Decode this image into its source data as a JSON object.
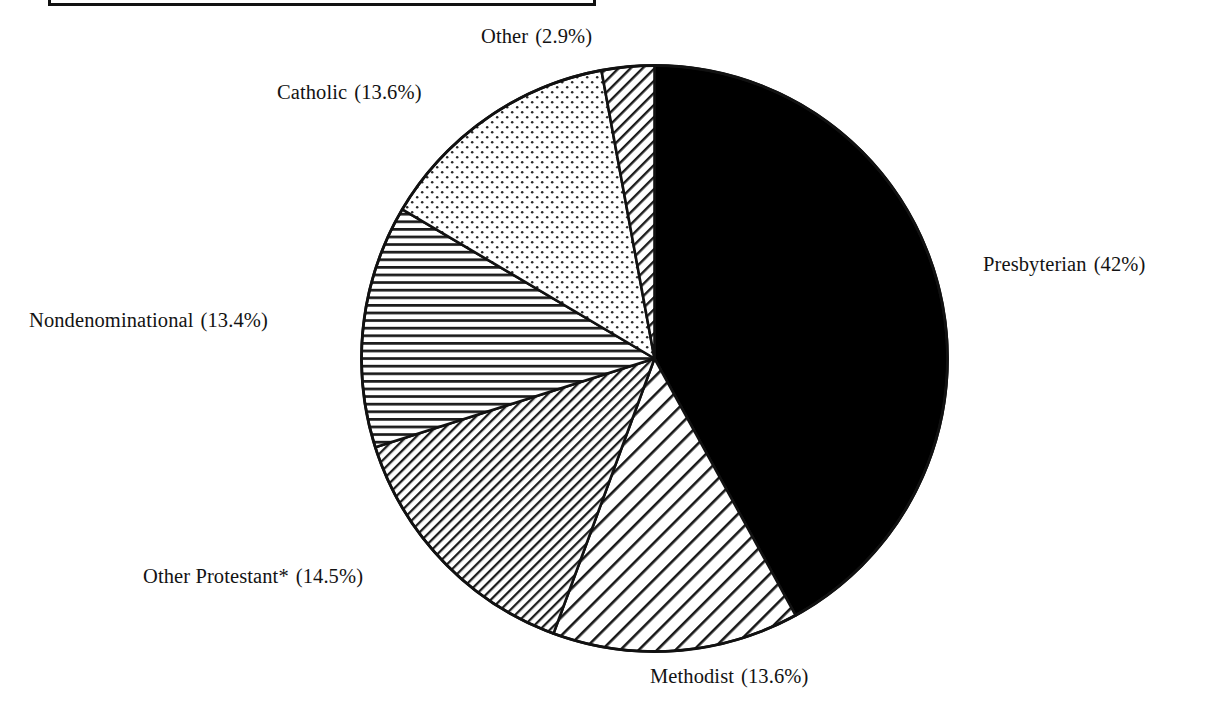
{
  "caption": {
    "text": "",
    "box_visible": true
  },
  "chart_data": {
    "type": "pie",
    "title": "",
    "subtitle": "",
    "xlabel": "",
    "ylabel": "",
    "legend_position": "labels-outside",
    "grid": false,
    "start_angle_deg": 0,
    "direction": "clockwise",
    "footnote_marker": "*",
    "categories": [
      "Presbyterian",
      "Methodist",
      "Other Protestant*",
      "Nondenominational",
      "Catholic",
      "Other"
    ],
    "values": [
      42,
      13.6,
      14.5,
      13.4,
      13.6,
      2.9
    ],
    "value_unit": "%",
    "slices": [
      {
        "name": "Presbyterian",
        "label": "Presbyterian",
        "value": 42,
        "percent_text": "(42%)",
        "fill": "solid-black",
        "color": "#000000"
      },
      {
        "name": "Methodist",
        "label": "Methodist",
        "value": 13.6,
        "percent_text": "(13.6%)",
        "fill": "diagonal-hatch-wide",
        "color": "#ffffff"
      },
      {
        "name": "Other Protestant",
        "label": "Other Protestant*",
        "value": 14.5,
        "percent_text": "(14.5%)",
        "fill": "diagonal-hatch-dense",
        "color": "#ffffff"
      },
      {
        "name": "Nondenominational",
        "label": "Nondenominational",
        "value": 13.4,
        "percent_text": "(13.4%)",
        "fill": "horizontal-lines",
        "color": "#ffffff"
      },
      {
        "name": "Catholic",
        "label": "Catholic",
        "value": 13.6,
        "percent_text": "(13.6%)",
        "fill": "dotted",
        "color": "#ffffff"
      },
      {
        "name": "Other",
        "label": "Other",
        "value": 2.9,
        "percent_text": "(2.9%)",
        "fill": "diagonal-hatch-medium",
        "color": "#ffffff"
      }
    ]
  },
  "labels": {
    "other": {
      "name": "Other",
      "pct": "(2.9%)"
    },
    "catholic": {
      "name": "Catholic",
      "pct": "(13.6%)"
    },
    "nondenominational": {
      "name": "Nondenominational",
      "pct": "(13.4%)"
    },
    "other_protestant": {
      "name": "Other Protestant*",
      "pct": "(14.5%)"
    },
    "methodist": {
      "name": "Methodist",
      "pct": "(13.6%)"
    },
    "presbyterian": {
      "name": "Presbyterian",
      "pct": "(42%)"
    }
  },
  "colors": {
    "outline": "#111111",
    "solid_slice": "#000000",
    "background": "#ffffff"
  }
}
